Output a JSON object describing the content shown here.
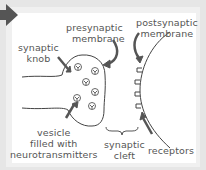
{
  "diagram": {
    "labels": {
      "synaptic_knob": [
        "synaptic",
        "knob"
      ],
      "presynaptic_membrane": [
        "presynaptic",
        "membrane"
      ],
      "postsynaptic_membrane": [
        "postsynaptic",
        "membrane"
      ],
      "vesicle": [
        "vesicle",
        "filled with",
        "neurotransmitters"
      ],
      "synaptic_cleft": [
        "synaptic",
        "cleft"
      ],
      "receptors": "receptors"
    },
    "colors": {
      "background": "#e6e6e6",
      "panel": "#ffffff",
      "arrow": "#555555",
      "line": "#444444",
      "text": "#555555"
    },
    "vesicle_count": 6,
    "receptor_count": 4
  }
}
